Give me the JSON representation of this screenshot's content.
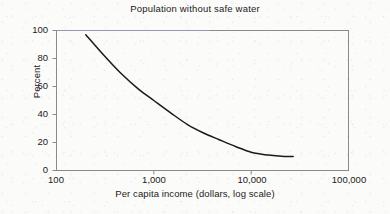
{
  "chart_data": {
    "type": "line",
    "title": "Population without safe water",
    "xlabel": "Per capita income (dollars, log scale)",
    "ylabel": "Percent",
    "xscale": "log",
    "yscale": "linear",
    "xlim": [
      100,
      100000
    ],
    "ylim": [
      0,
      100
    ],
    "grid": false,
    "legend": null,
    "x_ticks": [
      {
        "value": 100,
        "label": "100"
      },
      {
        "value": 1000,
        "label": "1,000"
      },
      {
        "value": 10000,
        "label": "10,000"
      },
      {
        "value": 100000,
        "label": "100,000"
      }
    ],
    "y_ticks": [
      {
        "value": 0,
        "label": "0"
      },
      {
        "value": 20,
        "label": "20"
      },
      {
        "value": 40,
        "label": "40"
      },
      {
        "value": 60,
        "label": "60"
      },
      {
        "value": 80,
        "label": "80"
      },
      {
        "value": 100,
        "label": "100"
      }
    ],
    "series": [
      {
        "name": "Population without safe water",
        "color": "#1a1a1a",
        "x": [
          200,
          300,
          450,
          700,
          1000,
          1500,
          2200,
          3200,
          4700,
          7000,
          10000,
          15000,
          22000,
          27000
        ],
        "y": [
          97,
          83,
          70,
          58,
          50,
          41,
          33,
          27,
          22,
          17,
          13,
          11,
          10,
          10
        ]
      }
    ]
  },
  "style": {
    "frame_color": "#8a8a8c",
    "text_color": "#1c1a1b",
    "background": "#fbfbfa",
    "curve_color": "#1a1a1a"
  }
}
